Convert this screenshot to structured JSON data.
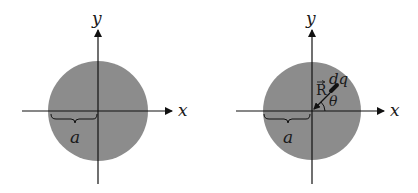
{
  "figure_left": {
    "axis_x_label": "x",
    "axis_y_label": "y",
    "radius_label": "a",
    "disk_color": "#8c8c8c"
  },
  "figure_right": {
    "axis_x_label": "x",
    "axis_y_label": "y",
    "radius_label": "a",
    "vector_label": "R",
    "charge_label": "dq",
    "angle_label": "θ",
    "disk_color": "#8c8c8c"
  }
}
